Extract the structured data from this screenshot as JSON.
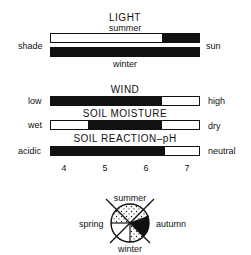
{
  "light": {
    "title": "LIGHT",
    "summer_label": "summer",
    "winter_label": "winter",
    "left_label": "shade",
    "right_label": "sun",
    "summer_range": [
      0.75,
      1.0
    ],
    "winter_range": [
      0.0,
      1.0
    ]
  },
  "wind": {
    "title": "WIND",
    "left_label": "low",
    "right_label": "high",
    "range": [
      0.0,
      0.75
    ]
  },
  "soil_moisture": {
    "title": "SOIL MOISTURE",
    "left_label": "wet",
    "right_label": "dry",
    "range": [
      0.25,
      0.75
    ]
  },
  "soil_ph": {
    "title": "SOIL REACTION–pH",
    "left_label": "acidic",
    "right_label": "neutral",
    "range": [
      0.0,
      0.77
    ],
    "ticks": [
      "4",
      "5",
      "6",
      "7"
    ]
  },
  "seasons": {
    "top": "summer",
    "left": "spring",
    "right": "autumn",
    "bottom": "winter"
  },
  "colors": {
    "ink": "#111111",
    "paper": "#ffffff"
  }
}
